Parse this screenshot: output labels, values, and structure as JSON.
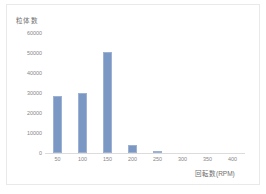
{
  "chart_data": {
    "type": "bar",
    "title": "",
    "subtitle": "",
    "ylabel": "粒体数",
    "xlabel": "回転数(RPM)",
    "categories": [
      "50",
      "100",
      "150",
      "200",
      "250",
      "300",
      "350",
      "400"
    ],
    "x": [
      50,
      100,
      150,
      200,
      250,
      300,
      350,
      400
    ],
    "values": [
      28500,
      30200,
      50500,
      4200,
      250,
      0,
      0,
      0
    ],
    "series": [
      {
        "name": "粒体数",
        "values": [
          28500,
          30200,
          50500,
          4200,
          250,
          0,
          0,
          0
        ]
      }
    ],
    "ylim": [
      0,
      63000
    ],
    "xlim": [
      25,
      425
    ],
    "yticks": [
      0,
      10000,
      20000,
      30000,
      40000,
      50000,
      60000
    ],
    "ytick_labels": [
      "0",
      "10000",
      "20000",
      "30000",
      "40000",
      "50000",
      "60000"
    ],
    "xticks": [
      50,
      100,
      150,
      200,
      250,
      300,
      350,
      400
    ],
    "xtick_labels": [
      "50",
      "100",
      "150",
      "200",
      "250",
      "300",
      "350",
      "400"
    ],
    "grid": false,
    "legend": null,
    "legend_position": "none",
    "bar_color": "#7b98c4",
    "bar_edge_color": "#9db2d2",
    "axis_color": "#dcdcdc",
    "tick_label_color": "#868686",
    "axis_title_color": "#6f6f6f",
    "background": "#ffffff",
    "border_color": "#e9e9e9",
    "annotations": []
  }
}
